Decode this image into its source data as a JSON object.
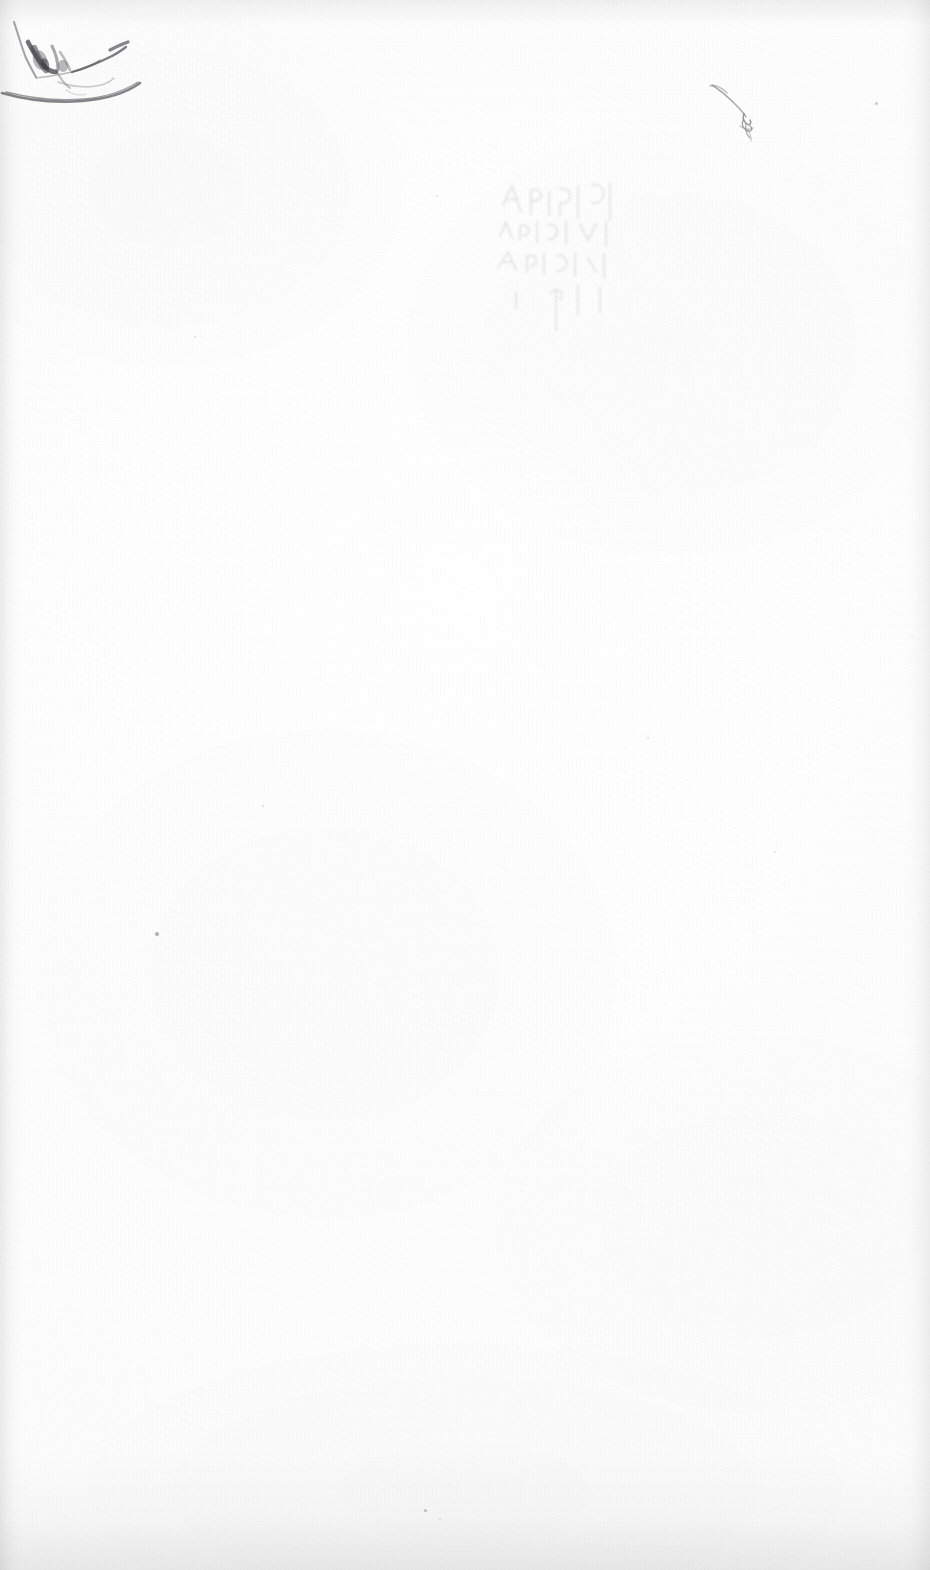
{
  "page": {
    "kind": "scanned-blank-page",
    "width": 930,
    "height": 1570,
    "background_color": "#fdfdfd",
    "paper_tone": "#fbfbfb",
    "content_text": "",
    "description_label": "Blank scanned sheet"
  },
  "marks": {
    "top_left_handwriting": {
      "name": "top-left-handwriting-mark",
      "ink_color": "#5a5a5e",
      "label": "faint handwritten stroke",
      "x": 4,
      "y": 18,
      "width": 140,
      "height": 90
    },
    "top_left_sweep": {
      "name": "top-left-sweeping-curve",
      "ink_color": "#6b6b70",
      "label": "long sweeping curved stroke",
      "x": 2,
      "y": 78,
      "width": 148,
      "height": 28
    },
    "top_right_squiggle": {
      "name": "top-right-squiggle-mark",
      "ink_color": "#9a9aa0",
      "label": "thin diagonal stroke with small scribble",
      "x": 706,
      "y": 82,
      "width": 54,
      "height": 56
    },
    "bleed_through": {
      "name": "bleed-through-text-ghost",
      "ink_color": "#c9c9cd",
      "label": "faint show-through of writing from reverse side",
      "x": 495,
      "y": 180,
      "width": 145,
      "height": 135
    }
  },
  "specks": [
    {
      "name": "speck-upper-right",
      "x": 876,
      "y": 103,
      "size": 3.0,
      "opacity": 0.45
    },
    {
      "name": "speck-upper-left",
      "x": 195,
      "y": 337,
      "size": 2.4,
      "opacity": 0.28
    },
    {
      "name": "speck-mid-right",
      "x": 648,
      "y": 738,
      "size": 2.6,
      "opacity": 0.26
    },
    {
      "name": "speck-mid-left",
      "x": 263,
      "y": 806,
      "size": 2.8,
      "opacity": 0.3
    },
    {
      "name": "speck-center-left",
      "x": 157,
      "y": 934,
      "size": 3.4,
      "opacity": 0.62
    },
    {
      "name": "speck-lower-center",
      "x": 425,
      "y": 1510,
      "size": 3.0,
      "opacity": 0.5
    },
    {
      "name": "speck-lower-right",
      "x": 440,
      "y": 1519,
      "size": 1.8,
      "opacity": 0.24
    },
    {
      "name": "speck-upper-mid",
      "x": 437,
      "y": 196,
      "size": 2.0,
      "opacity": 0.22
    },
    {
      "name": "speck-mid-low",
      "x": 775,
      "y": 852,
      "size": 2.0,
      "opacity": 0.2
    }
  ]
}
